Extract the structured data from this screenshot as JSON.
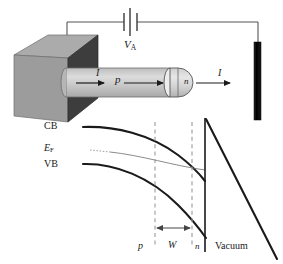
{
  "figure": {
    "background_color": "#ffffff"
  },
  "device": {
    "substrate_block": {
      "name": "semiconductor substrate block",
      "top_face_color": "#a9a9a9",
      "front_face_color": "#9b9b9b",
      "right_face_color": "#3d3d3d"
    },
    "tip": {
      "body_label": "p",
      "apex_label": "n",
      "body_color": "#c8c8c8",
      "apex_color": "#d5d5d5"
    },
    "current_left_label": "I",
    "current_right_label": "I",
    "battery_label": "V",
    "battery_sub": "A",
    "anode": {
      "name": "anode electrode",
      "color": "#0d0d0d"
    }
  },
  "band_diagram": {
    "cb_label": "CB",
    "ef_label": "E",
    "ef_sub": "F",
    "vb_label": "VB",
    "region_p_label": "p",
    "region_w_label": "W",
    "region_n_label": "n",
    "vacuum_label": "Vacuum"
  },
  "colors": {
    "line": "#1a1a1a",
    "dashed_guide": "#8a8a8a",
    "thin_wire": "#555555"
  }
}
